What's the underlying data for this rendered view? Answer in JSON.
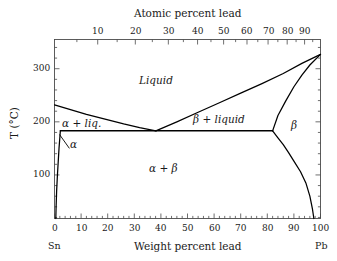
{
  "figure": {
    "kind": "binary-eutectic-phase-diagram",
    "system": "Sn-Pb"
  },
  "axes": {
    "top": {
      "title": "Atomic percent lead",
      "tick_labels": [
        "10",
        "20",
        "30",
        "40",
        "50",
        "60",
        "70",
        "80",
        "90"
      ],
      "tick_values": [
        10,
        20,
        30,
        40,
        50,
        60,
        70,
        80,
        90
      ]
    },
    "bottom": {
      "title": "Weight percent lead",
      "tick_labels": [
        "0",
        "10",
        "20",
        "30",
        "40",
        "50",
        "60",
        "70",
        "80",
        "90",
        "100"
      ],
      "tick_values": [
        0,
        10,
        20,
        30,
        40,
        50,
        60,
        70,
        80,
        90,
        100
      ],
      "left_end_label": "Sn",
      "right_end_label": "Pb",
      "range": [
        0,
        100
      ]
    },
    "left": {
      "title": "T (°C)",
      "tick_labels": [
        "100",
        "200",
        "300"
      ],
      "tick_values": [
        100,
        200,
        300
      ],
      "range": [
        18,
        355
      ]
    }
  },
  "regions": [
    {
      "id": "liquid",
      "label": "Liquid",
      "x": 38,
      "y": 278
    },
    {
      "id": "alpha-liquid",
      "label": "α + liq.",
      "x": 10,
      "y": 196
    },
    {
      "id": "beta-liquid",
      "label": "β + liquid",
      "x": 62,
      "y": 205
    },
    {
      "id": "beta",
      "label": "β",
      "x": 90,
      "y": 193
    },
    {
      "id": "alpha",
      "label": "α",
      "x": 7,
      "y": 158
    },
    {
      "id": "alpha-beta",
      "label": "α + β",
      "x": 41,
      "y": 113
    }
  ],
  "chart_data": {
    "type": "line",
    "xlabel": "Weight percent lead",
    "ylabel": "T (°C)",
    "xlim": [
      0,
      100
    ],
    "ylim": [
      18,
      355
    ],
    "grid": false,
    "legend": "none",
    "annotations": {
      "eutectic_point": {
        "wt_pct_pb": 38.1,
        "temperature_C": 183
      },
      "melting_point_Sn": {
        "wt_pct_pb": 0,
        "temperature_C": 232
      },
      "melting_point_Pb": {
        "wt_pct_pb": 100,
        "temperature_C": 327
      },
      "max_solubility_alpha": {
        "wt_pct_pb": 18.3,
        "temperature_C": 183
      },
      "max_solubility_beta": {
        "wt_pct_pb": 82,
        "temperature_C": 183
      }
    },
    "series": [
      {
        "name": "liquidus (Sn-rich)",
        "points": [
          [
            0,
            232
          ],
          [
            6,
            223
          ],
          [
            12,
            214
          ],
          [
            19,
            205
          ],
          [
            26,
            196
          ],
          [
            32,
            189
          ],
          [
            38.1,
            183
          ]
        ]
      },
      {
        "name": "liquidus (Pb-rich)",
        "points": [
          [
            38.1,
            183
          ],
          [
            46,
            200
          ],
          [
            54,
            218
          ],
          [
            62,
            236
          ],
          [
            70,
            254
          ],
          [
            78,
            272
          ],
          [
            86,
            291
          ],
          [
            93,
            310
          ],
          [
            100,
            327
          ]
        ]
      },
      {
        "name": "solidus (beta)",
        "points": [
          [
            100,
            327
          ],
          [
            96,
            307
          ],
          [
            93,
            288
          ],
          [
            90,
            266
          ],
          [
            87,
            240
          ],
          [
            84,
            212
          ],
          [
            82,
            183
          ]
        ]
      },
      {
        "name": "eutectic isotherm",
        "points": [
          [
            2.2,
            183
          ],
          [
            38.1,
            183
          ],
          [
            82,
            183
          ]
        ]
      },
      {
        "name": "solvus (alpha)",
        "points": [
          [
            2.2,
            183
          ],
          [
            2.0,
            170
          ],
          [
            1.7,
            150
          ],
          [
            1.4,
            125
          ],
          [
            1.1,
            100
          ],
          [
            0.8,
            70
          ],
          [
            0.6,
            40
          ],
          [
            0.5,
            18
          ]
        ]
      },
      {
        "name": "solvus (beta)",
        "points": [
          [
            82,
            183
          ],
          [
            84,
            170
          ],
          [
            86,
            157
          ],
          [
            88,
            142
          ],
          [
            90,
            126
          ],
          [
            92.5,
            106
          ],
          [
            94.5,
            85
          ],
          [
            96,
            60
          ],
          [
            97,
            35
          ],
          [
            97.5,
            18
          ]
        ]
      }
    ]
  },
  "colors": {
    "line": "#000000",
    "axis": "#4a4a4a",
    "text": "#1a1a1a",
    "background": "#ffffff"
  }
}
